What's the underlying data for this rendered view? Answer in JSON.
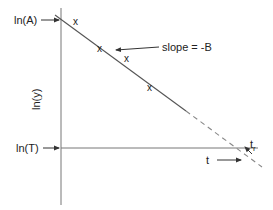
{
  "diagram": {
    "type": "semilog-decay-plot",
    "colors": {
      "stroke": "#555555",
      "text": "#222222"
    },
    "y_axis_label": "ln(y)",
    "x_axis_label": "t",
    "y_intercept_label": "ln(A)",
    "threshold_label": "ln(T)",
    "slope_label": "slope = -B",
    "crossing_label_main": "t",
    "crossing_label_sub": "r",
    "data_markers": [
      {
        "symbol": "x",
        "x": 76,
        "y": 22
      },
      {
        "symbol": "x",
        "x": 100,
        "y": 50
      },
      {
        "symbol": "x",
        "x": 127,
        "y": 60
      },
      {
        "symbol": "x",
        "x": 150,
        "y": 89
      }
    ]
  }
}
